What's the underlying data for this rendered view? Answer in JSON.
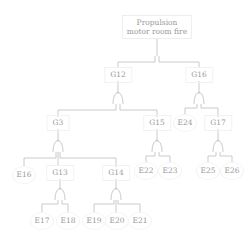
{
  "diagram": {
    "type": "fault-tree",
    "colors": {
      "line": "#bdbdbd",
      "text": "#9a9a9a",
      "node_border": "#eeeeee",
      "background": "#ffffff"
    },
    "top_event": {
      "id": "TOP",
      "line1": "Propulsion",
      "line2": "motor room fire",
      "x": 157,
      "y": 27
    },
    "nodes": [
      {
        "id": "G12",
        "label": "G12",
        "kind": "gate",
        "x": 118,
        "y": 75
      },
      {
        "id": "G16",
        "label": "G16",
        "kind": "gate",
        "x": 199,
        "y": 75
      },
      {
        "id": "G3",
        "label": "G3",
        "kind": "gate",
        "x": 58,
        "y": 123
      },
      {
        "id": "G15",
        "label": "G15",
        "kind": "gate",
        "x": 157,
        "y": 123
      },
      {
        "id": "E24",
        "label": "E24",
        "kind": "event",
        "x": 185,
        "y": 123
      },
      {
        "id": "G17",
        "label": "G17",
        "kind": "gate",
        "x": 218,
        "y": 123
      },
      {
        "id": "E16",
        "label": "E16",
        "kind": "event",
        "x": 24,
        "y": 175
      },
      {
        "id": "G13",
        "label": "G13",
        "kind": "gate",
        "x": 60,
        "y": 173
      },
      {
        "id": "G14",
        "label": "G14",
        "kind": "gate",
        "x": 116,
        "y": 173
      },
      {
        "id": "E22",
        "label": "E22",
        "kind": "event",
        "x": 146,
        "y": 171
      },
      {
        "id": "E23",
        "label": "E23",
        "kind": "event",
        "x": 170,
        "y": 171
      },
      {
        "id": "E25",
        "label": "E25",
        "kind": "event",
        "x": 208,
        "y": 171
      },
      {
        "id": "E26",
        "label": "E26",
        "kind": "event",
        "x": 232,
        "y": 171
      },
      {
        "id": "E17",
        "label": "E17",
        "kind": "event",
        "x": 42,
        "y": 221
      },
      {
        "id": "E18",
        "label": "E18",
        "kind": "event",
        "x": 68,
        "y": 221
      },
      {
        "id": "E19",
        "label": "E19",
        "kind": "event",
        "x": 94,
        "y": 221
      },
      {
        "id": "E20",
        "label": "E20",
        "kind": "event",
        "x": 117,
        "y": 221
      },
      {
        "id": "E21",
        "label": "E21",
        "kind": "event",
        "x": 140,
        "y": 221
      }
    ],
    "edges": [
      [
        "TOP",
        "G12"
      ],
      [
        "TOP",
        "G16"
      ],
      [
        "G12",
        "G3"
      ],
      [
        "G12",
        "G15"
      ],
      [
        "G16",
        "E24"
      ],
      [
        "G16",
        "G17"
      ],
      [
        "G3",
        "E16"
      ],
      [
        "G3",
        "G13"
      ],
      [
        "G3",
        "G14"
      ],
      [
        "G15",
        "E22"
      ],
      [
        "G15",
        "E23"
      ],
      [
        "G17",
        "E25"
      ],
      [
        "G17",
        "E26"
      ],
      [
        "G13",
        "E17"
      ],
      [
        "G13",
        "E18"
      ],
      [
        "G14",
        "E19"
      ],
      [
        "G14",
        "E20"
      ],
      [
        "G14",
        "E21"
      ]
    ]
  }
}
